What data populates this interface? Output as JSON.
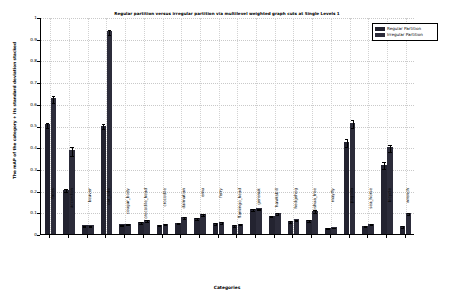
{
  "chart_data": {
    "type": "bar",
    "title": "Regular partition versus irregular partition via multilevel weighted graph cuts at Single Levels 1",
    "xlabel": "Categories",
    "ylabel": "The mAP of the category + its standard deviation stacked",
    "ylim": [
      0,
      1
    ],
    "yticks": [
      "0",
      "0.1",
      "0.2",
      "0.3",
      "0.4",
      "0.5",
      "0.6",
      "0.7",
      "0.8",
      "0.9",
      "1"
    ],
    "ytick_values": [
      0,
      0.1,
      0.2,
      0.3,
      0.4,
      0.5,
      0.6,
      0.7,
      0.8,
      0.9,
      1
    ],
    "grid": true,
    "legend_position": "upper right",
    "categories": [
      "faces",
      "accordion",
      "beaver",
      "car_side",
      "cougar_body",
      "crocodile_head",
      "crocodile",
      "dalmatian",
      "emu",
      "ferry",
      "flamingo_head",
      "gerenuk",
      "hawksbill",
      "hedgehog",
      "joshua_tree",
      "mayfly",
      "pagoda",
      "sea_horse",
      "bicycle",
      "wrench"
    ],
    "series": [
      {
        "name": "Regular Partition",
        "color": "#232330",
        "values": [
          0.505,
          0.205,
          0.04,
          0.5,
          0.045,
          0.055,
          0.043,
          0.052,
          0.075,
          0.05,
          0.042,
          0.115,
          0.085,
          0.06,
          0.065,
          0.028,
          0.425,
          0.038,
          0.32,
          0.037
        ],
        "errors": [
          0.012,
          0.008,
          0.003,
          0.012,
          0.003,
          0.003,
          0.003,
          0.003,
          0.004,
          0.003,
          0.003,
          0.004,
          0.004,
          0.003,
          0.004,
          0.002,
          0.018,
          0.003,
          0.015,
          0.003
        ]
      },
      {
        "name": "Irregular Partition",
        "color": "#2c2c3a",
        "values": [
          0.625,
          0.385,
          0.04,
          0.935,
          0.047,
          0.065,
          0.048,
          0.078,
          0.092,
          0.055,
          0.047,
          0.118,
          0.098,
          0.068,
          0.108,
          0.032,
          0.51,
          0.048,
          0.4,
          0.097
        ],
        "errors": [
          0.015,
          0.022,
          0.003,
          0.012,
          0.003,
          0.004,
          0.003,
          0.004,
          0.004,
          0.003,
          0.003,
          0.004,
          0.004,
          0.003,
          0.005,
          0.002,
          0.018,
          0.003,
          0.016,
          0.004
        ]
      }
    ]
  },
  "legend": {
    "items": [
      {
        "label": "Regular Partition"
      },
      {
        "label": "Irregular Partition"
      }
    ]
  }
}
